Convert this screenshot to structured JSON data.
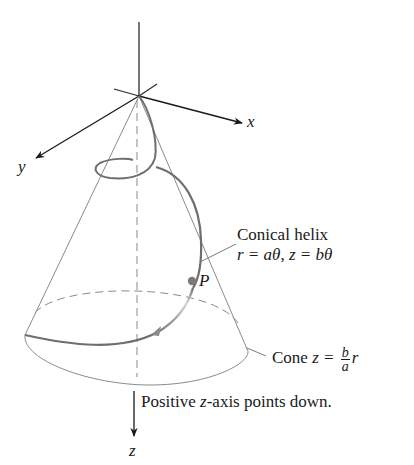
{
  "figure": {
    "axes": {
      "x_label": "x",
      "y_label": "y",
      "z_label": "z"
    },
    "helix_label": {
      "title": "Conical helix",
      "equation": "r = aθ, z = bθ"
    },
    "point_label": "P",
    "cone_label": {
      "prefix": "Cone ",
      "lhs": "z = ",
      "frac_num": "b",
      "frac_den": "a",
      "rhs": "r"
    },
    "axis_note": {
      "prefix": "Positive ",
      "var": "z",
      "suffix": "-axis points down."
    },
    "colors": {
      "axis": "#1a1a1a",
      "cone": "#7a7a7a",
      "helix": "#6e6e6e",
      "helix_fade": "#c8c8c8",
      "point": "#7a7a7a"
    }
  }
}
